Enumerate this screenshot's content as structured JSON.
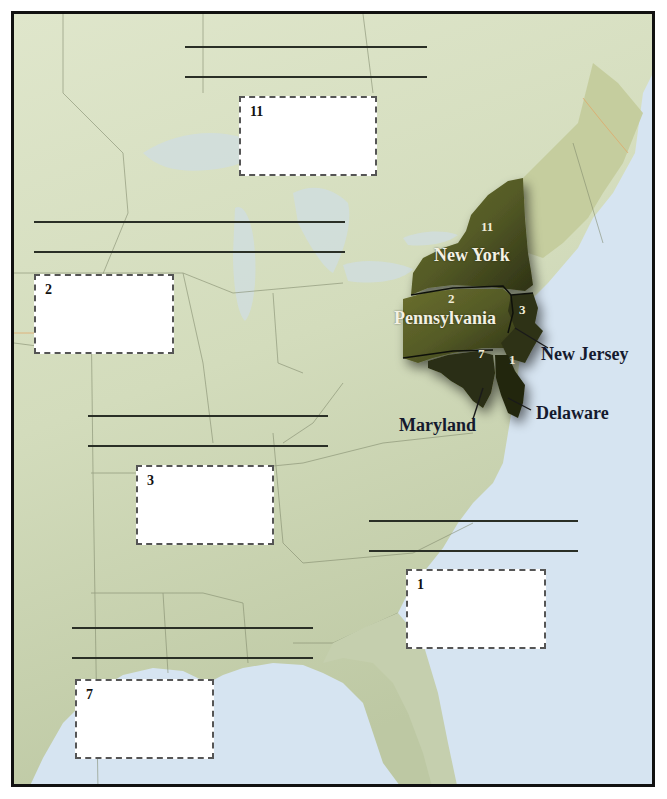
{
  "map": {
    "title_visible": false,
    "theme": "Middle Colonies worksheet map",
    "colors": {
      "land": "#d7dfc2",
      "land_south": "#c5cfae",
      "ocean": "#d6e4f1",
      "highlight_region": "#4d5222",
      "highlight_dark": "#262a12",
      "border": "#111111",
      "box_border": "#555555",
      "answer_line": "#2a2f26"
    },
    "highlighted_states": [
      {
        "name": "New York",
        "number": "11"
      },
      {
        "name": "Pennsylvania",
        "number": "2"
      },
      {
        "name": "New Jersey",
        "number": "3"
      },
      {
        "name": "Maryland",
        "number": "7"
      },
      {
        "name": "Delaware",
        "number": "1"
      }
    ]
  },
  "labels": {
    "new_york": "New York",
    "new_york_num": "11",
    "pennsylvania": "Pennsylvania",
    "pennsylvania_num": "2",
    "new_jersey": "New Jersey",
    "new_jersey_num": "3",
    "maryland": "Maryland",
    "maryland_num": "7",
    "delaware": "Delaware",
    "delaware_num": "1"
  },
  "answer_blocks": [
    {
      "number": "11",
      "line1": "",
      "line2": "",
      "box_text": ""
    },
    {
      "number": "2",
      "line1": "",
      "line2": "",
      "box_text": ""
    },
    {
      "number": "3",
      "line1": "",
      "line2": "",
      "box_text": ""
    },
    {
      "number": "1",
      "line1": "",
      "line2": "",
      "box_text": ""
    },
    {
      "number": "7",
      "line1": "",
      "line2": "",
      "box_text": ""
    }
  ]
}
